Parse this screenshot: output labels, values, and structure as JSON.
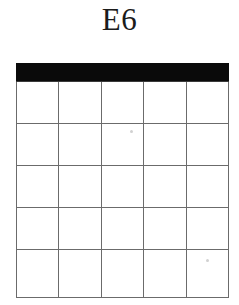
{
  "figure": {
    "caption": "E6",
    "colors": {
      "background": "#ffffff",
      "header_band": "#0a0a0a",
      "grid_line": "#6b6b6b",
      "caption_text": "#1b1b1b"
    }
  },
  "table": {
    "columns": 5,
    "rows": 5,
    "has_black_header_band": true,
    "header_cells": [
      "",
      "",
      "",
      "",
      ""
    ],
    "body_rows": [
      [
        "",
        "",
        "",
        "",
        ""
      ],
      [
        "",
        "",
        "",
        "",
        ""
      ],
      [
        "",
        "",
        "",
        "",
        ""
      ],
      [
        "",
        "",
        "",
        "",
        ""
      ],
      [
        "",
        "",
        "",
        "",
        ""
      ]
    ]
  },
  "artifacts": {
    "speckles": [
      {
        "x": 130,
        "y": 130
      },
      {
        "x": 206,
        "y": 259
      }
    ]
  }
}
